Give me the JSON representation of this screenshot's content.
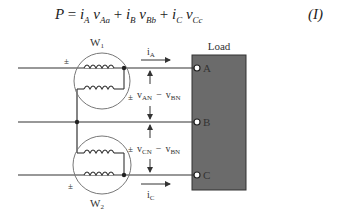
{
  "equation": {
    "lhs": "P",
    "equals": "=",
    "terms": [
      {
        "i": "i",
        "i_sub": "A",
        "v": "v",
        "v_sub": "Aa"
      },
      {
        "i": "i",
        "i_sub": "B",
        "v": "v",
        "v_sub": "Bb"
      },
      {
        "i": "i",
        "i_sub": "C",
        "v": "v",
        "v_sub": "Cc"
      }
    ],
    "plus": "+",
    "number": "(I)"
  },
  "diagram": {
    "load_label": "Load",
    "load_color": "#6b6b6b",
    "terminals": [
      "A",
      "B",
      "C"
    ],
    "wattmeters": [
      {
        "label": "W",
        "sub": "1"
      },
      {
        "label": "W",
        "sub": "2"
      }
    ],
    "polarity_mark": "±",
    "currents": [
      {
        "label": "i",
        "sub": "A"
      },
      {
        "label": "i",
        "sub": "C"
      }
    ],
    "voltages": [
      {
        "v1": "v",
        "v1_sub": "AN",
        "minus": "−",
        "v2": "v",
        "v2_sub": "BN"
      },
      {
        "v1": "v",
        "v1_sub": "CN",
        "minus": "−",
        "v2": "v",
        "v2_sub": "BN"
      }
    ]
  }
}
